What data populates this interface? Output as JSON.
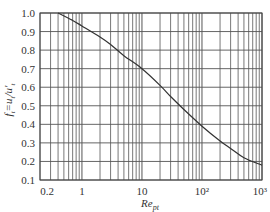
{
  "chart_data": {
    "type": "line",
    "title": "",
    "xlabel": "Re_pt",
    "ylabel": "f_t = u_t / u'_t",
    "xscale": "log",
    "xlim": [
      0.2,
      1000
    ],
    "ylim": [
      0.1,
      1.0
    ],
    "grid": true,
    "legend": null,
    "x_tick_labels": [
      "0.2",
      "1",
      "10",
      "10²",
      "10³"
    ],
    "x_tick_values": [
      0.2,
      1,
      10,
      100,
      1000
    ],
    "y_tick_labels": [
      "1.0",
      "0.9",
      "0.8",
      "0.7",
      "0.6",
      "0.5",
      "0.4",
      "0.3",
      "0.2",
      "0.1"
    ],
    "y_tick_values": [
      1.0,
      0.9,
      0.8,
      0.7,
      0.6,
      0.5,
      0.4,
      0.3,
      0.2,
      0.1
    ],
    "series": [
      {
        "name": "f_t",
        "x": [
          0.4,
          0.7,
          1,
          2,
          3,
          5,
          10,
          20,
          30,
          50,
          100,
          200,
          300,
          500,
          1000
        ],
        "values": [
          1.0,
          0.96,
          0.93,
          0.87,
          0.83,
          0.77,
          0.7,
          0.61,
          0.55,
          0.48,
          0.39,
          0.31,
          0.27,
          0.22,
          0.18
        ]
      }
    ]
  },
  "labels": {
    "ylabel_main": "f",
    "ylabel_sub": "t",
    "ylabel_rest": "=u",
    "xlabel_main": "Re",
    "xlabel_sub": "pt"
  },
  "colors": {
    "grid": "#555555",
    "curve": "#333333",
    "text": "#333333"
  }
}
